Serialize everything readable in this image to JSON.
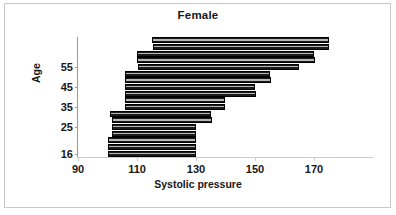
{
  "chart": {
    "title": "Female",
    "xlabel": "Systolic pressure",
    "ylabel": "Age"
  },
  "axes": {
    "x_ticks": [
      "90",
      "110",
      "130",
      "150",
      "170"
    ],
    "y_ticks": [
      "55",
      "45",
      "35",
      "25",
      "16"
    ]
  },
  "chart_data": {
    "type": "bar",
    "orientation": "horizontal",
    "subtype": "floating-range-bar",
    "title": "Female",
    "xlabel": "Systolic pressure",
    "ylabel": "Age",
    "xlim": [
      90,
      190
    ],
    "xticks": [
      90,
      110,
      130,
      150,
      170
    ],
    "yticks": [
      16,
      25,
      35,
      45,
      55
    ],
    "grid": false,
    "legend": null,
    "bar_color": "#1c1c1c",
    "bar_edge_color": "#000000",
    "n_bars": 14,
    "note": "Each bar spans the systolic pressure range for one age group; bars ordered oldest (top) to youngest (bottom).",
    "bars": [
      {
        "index": 1,
        "low": 115.0,
        "high": 175.0
      },
      {
        "index": 2,
        "low": 115.5,
        "high": 175.0
      },
      {
        "index": 3,
        "low": 110.0,
        "high": 170.0
      },
      {
        "index": 4,
        "low": 110.0,
        "high": 170.5
      },
      {
        "index": 5,
        "low": 110.5,
        "high": 165.0
      },
      {
        "index": 6,
        "low": 106.0,
        "high": 155.0
      },
      {
        "index": 7,
        "low": 106.0,
        "high": 155.5
      },
      {
        "index": 8,
        "low": 106.0,
        "high": 150.0
      },
      {
        "index": 9,
        "low": 106.0,
        "high": 150.5
      },
      {
        "index": 10,
        "low": 106.0,
        "high": 140.0
      },
      {
        "index": 11,
        "low": 106.0,
        "high": 140.0
      },
      {
        "index": 12,
        "low": 101.0,
        "high": 135.0
      },
      {
        "index": 13,
        "low": 101.5,
        "high": 135.5
      },
      {
        "index": 14,
        "low": 101.5,
        "high": 130.0
      },
      {
        "index": 15,
        "low": 101.5,
        "high": 130.0
      },
      {
        "index": 16,
        "low": 100.0,
        "high": 130.0
      },
      {
        "index": 17,
        "low": 100.0,
        "high": 130.0
      },
      {
        "index": 18,
        "low": 100.0,
        "high": 130.0
      }
    ]
  }
}
